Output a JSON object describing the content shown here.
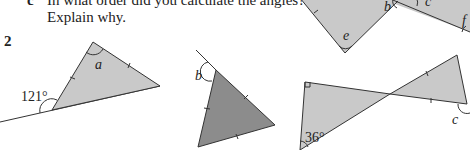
{
  "question_part_c": {
    "letter": "c",
    "line1": "In what order did you calculate the angles?",
    "line2": "Explain why."
  },
  "question_number": "2",
  "colors": {
    "light_fill": "#c9c9c9",
    "dark_fill": "#8c8c8c",
    "stroke": "#333333"
  },
  "top_right_figure": {
    "angle_labels": [
      "b",
      "c",
      "e",
      "f"
    ]
  },
  "figure_1": {
    "angle_given": "121°",
    "angle_unknown": "a"
  },
  "figure_2": {
    "angle_unknown": "b"
  },
  "figure_3": {
    "angle_given": "36°",
    "angle_unknown": "c"
  }
}
